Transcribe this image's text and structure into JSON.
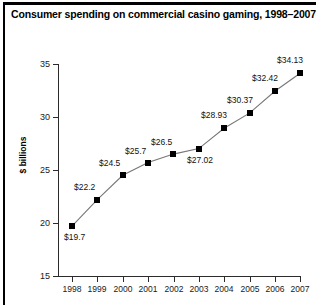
{
  "title": "Consumer spending on commercial casino gaming, 1998–2007",
  "axis": {
    "y_title": "$ billions",
    "y_ticks": [
      "15",
      "20",
      "25",
      "30",
      "35"
    ],
    "x_ticks": [
      "1998",
      "1999",
      "2000",
      "2001",
      "2002",
      "2003",
      "2004",
      "2005",
      "2006",
      "2007"
    ]
  },
  "labels": {
    "p0": "$19.7",
    "p1": "$22.2",
    "p2": "$24.5",
    "p3": "$25.7",
    "p4": "$26.5",
    "p5": "$27.02",
    "p6": "$28.93",
    "p7": "$30.37",
    "p8": "$32.42",
    "p9": "$34.13"
  },
  "colors": {
    "marker": "#000000",
    "line": "#777777",
    "rule": "#000000",
    "text": "#111111"
  },
  "chart_data": {
    "type": "line",
    "title": "Consumer spending on commercial casino gaming, 1998–2007",
    "xlabel": "",
    "ylabel": "$ billions",
    "categories": [
      "1998",
      "1999",
      "2000",
      "2001",
      "2002",
      "2003",
      "2004",
      "2005",
      "2006",
      "2007"
    ],
    "values": [
      19.7,
      22.2,
      24.5,
      25.7,
      26.5,
      27.02,
      28.93,
      30.37,
      32.42,
      34.13
    ],
    "point_labels": [
      "$19.7",
      "$22.2",
      "$24.5",
      "$25.7",
      "$26.5",
      "$27.02",
      "$28.93",
      "$30.37",
      "$32.42",
      "$34.13"
    ],
    "ylim": [
      15,
      35
    ],
    "ytick_values": [
      15,
      20,
      25,
      30,
      35
    ],
    "grid": false,
    "legend": false,
    "marker": "square"
  }
}
